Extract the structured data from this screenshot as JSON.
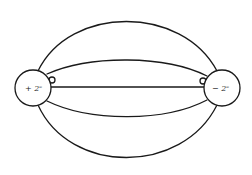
{
  "diagram": {
    "colors": {
      "line": "#1a1a1a",
      "background": "#ffffff"
    },
    "charges": [
      {
        "id": "positive",
        "label": "+ 2ᵉ",
        "cx": 33,
        "cy": 88,
        "r": 18
      },
      {
        "id": "negative",
        "label": "− 2ᵉ",
        "cx": 222,
        "cy": 88,
        "r": 18
      }
    ],
    "field_lines": [
      {
        "id": "outer-top",
        "d": "M 38 71 C 70 5, 182 5, 217 71"
      },
      {
        "id": "inner-top",
        "d": "M 47 74 C 90 55, 165 55, 207 76"
      },
      {
        "id": "center",
        "d": "M 51 87 L 204 87"
      },
      {
        "id": "inner-bottom",
        "d": "M 47 101 C 90 122, 165 122, 207 100"
      },
      {
        "id": "outer-bottom",
        "d": "M 38 105 C 70 175, 182 175, 217 105"
      }
    ],
    "loops": [
      {
        "id": "loop-left",
        "cx": 52,
        "cy": 80,
        "r": 3
      },
      {
        "id": "loop-right",
        "cx": 203,
        "cy": 81,
        "r": 3
      }
    ]
  }
}
